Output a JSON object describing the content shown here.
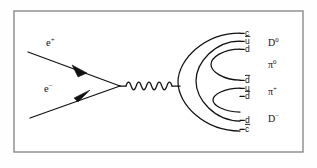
{
  "figure": {
    "name": "electron-positron-annihilation-feynman-diagram",
    "background_color": "#ffffff",
    "line_color": "#111111",
    "frame_color": "#8a8a8a"
  },
  "incoming": [
    {
      "id": "positron",
      "symbol": "e",
      "charge": "+",
      "label": "e+",
      "label_x": 46,
      "label_y": 46,
      "line": {
        "x1": 28,
        "y1": 52,
        "x2": 120,
        "y2": 86
      },
      "arrow_at": 0.55,
      "arrow_direction": "toward-upper-left"
    },
    {
      "id": "electron",
      "symbol": "e",
      "charge": "−",
      "label": "e-",
      "label_x": 44,
      "label_y": 92,
      "line": {
        "x1": 30,
        "y1": 118,
        "x2": 120,
        "y2": 86
      },
      "arrow_at": 0.55,
      "arrow_direction": "toward-lower-right"
    }
  ],
  "propagator": {
    "id": "photon",
    "type": "wavy",
    "label": "",
    "x_start": 126,
    "x_end": 172,
    "y": 86,
    "amplitude": 5.2,
    "cycles": 4.5
  },
  "hadronization": {
    "stub": {
      "x1": 172,
      "y1": 86,
      "x2": 180,
      "y2": 86
    },
    "arcs": [
      {
        "id": "arc-outer",
        "left_x": 178,
        "end_x": 240,
        "top_y": 33,
        "bottom_y": 131
      },
      {
        "id": "arc-second",
        "left_x": 196,
        "end_x": 240,
        "top_y": 41,
        "bottom_y": 121
      },
      {
        "id": "arc-third",
        "left_x": 211,
        "end_x": 240,
        "top_y": 49,
        "bottom_y": 80
      },
      {
        "id": "arc-inner",
        "left_x": 213,
        "end_x": 240,
        "top_y": 88,
        "bottom_y": 112
      }
    ]
  },
  "quark_labels": [
    {
      "id": "q1",
      "text": "c",
      "bar": false,
      "x": 245,
      "y": 36
    },
    {
      "id": "q2",
      "text": "u",
      "bar": true,
      "x": 245,
      "y": 44
    },
    {
      "id": "q3",
      "text": "d",
      "bar": false,
      "x": 245,
      "y": 52
    },
    {
      "id": "q4",
      "text": "d",
      "bar": true,
      "x": 245,
      "y": 83
    },
    {
      "id": "q5",
      "text": "u",
      "bar": false,
      "x": 245,
      "y": 91
    },
    {
      "id": "q6",
      "text": "d",
      "bar": true,
      "x": 245,
      "y": 99
    },
    {
      "id": "q7",
      "text": "d",
      "bar": false,
      "x": 245,
      "y": 123
    },
    {
      "id": "q8",
      "text": "c",
      "bar": true,
      "x": 245,
      "y": 132
    }
  ],
  "particle_labels": [
    {
      "id": "D0",
      "base": "D",
      "sup": "0",
      "x": 268,
      "y": 46
    },
    {
      "id": "pi0",
      "base": "π",
      "sup": "0",
      "x": 268,
      "y": 68
    },
    {
      "id": "piplus",
      "base": "π",
      "sup": "+",
      "x": 268,
      "y": 95
    },
    {
      "id": "Dminus",
      "base": "D",
      "sup": "−",
      "x": 268,
      "y": 122
    }
  ],
  "frame": {
    "x": 14,
    "y": 11,
    "width": 289,
    "height": 141
  }
}
